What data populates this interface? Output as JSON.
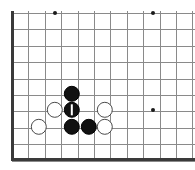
{
  "app": {
    "title": "Go Board Diagram",
    "board_type": "go-board",
    "view": "bottom-left-corner",
    "background_color": "#ffffff",
    "grid_line_color": "#8a8a8a",
    "border_line_color": "#3a3a3a",
    "black_stone_color": "#111111",
    "white_stone_color": "#ffffff",
    "white_stone_outline_color": "#4a4a4a",
    "star_point_color": "#1a1a1a",
    "move_marker_color": "#ffffff"
  },
  "board": {
    "width": 195,
    "height": 170,
    "cell_size": 16.4,
    "origin_x": 12,
    "origin_y": 13,
    "columns": 12,
    "rows": 10,
    "stone_radius": 8.2,
    "vertical_lines_x": [
      12,
      28.4,
      44.8,
      61.2,
      77.6,
      94,
      110.4,
      126.8,
      143.2,
      159.6,
      176,
      192.4
    ],
    "horizontal_lines_y": [
      13,
      29.4,
      45.8,
      62.2,
      78.6,
      95,
      111.4,
      127.8,
      144.2,
      160.6
    ],
    "borders": [
      {
        "name": "left-border",
        "orientation": "v",
        "x": 12,
        "y1": 11,
        "y2": 161
      },
      {
        "name": "bottom-border",
        "orientation": "h",
        "y": 159,
        "x1": 11,
        "x2": 195
      }
    ],
    "star_points": [
      {
        "name": "star-point-1",
        "x": 55,
        "y": 13
      },
      {
        "name": "star-point-2",
        "x": 153,
        "y": 13
      },
      {
        "name": "star-point-3",
        "x": 153,
        "y": 110
      }
    ],
    "stones": [
      {
        "id": "b1",
        "color": "black",
        "x": 72,
        "y": 94,
        "marked": false,
        "label": "black-stone"
      },
      {
        "id": "b2",
        "color": "black",
        "x": 72,
        "y": 110,
        "marked": true,
        "label": "black-stone-last-move"
      },
      {
        "id": "b3",
        "color": "black",
        "x": 72,
        "y": 127,
        "marked": false,
        "label": "black-stone"
      },
      {
        "id": "b4",
        "color": "black",
        "x": 89,
        "y": 127,
        "marked": false,
        "label": "black-stone"
      },
      {
        "id": "w1",
        "color": "white",
        "x": 55,
        "y": 110,
        "marked": false,
        "label": "white-stone"
      },
      {
        "id": "w2",
        "color": "white",
        "x": 105,
        "y": 110,
        "marked": false,
        "label": "white-stone"
      },
      {
        "id": "w3",
        "color": "white",
        "x": 105,
        "y": 127,
        "marked": false,
        "label": "white-stone"
      },
      {
        "id": "w4",
        "color": "white",
        "x": 39,
        "y": 127,
        "marked": false,
        "label": "white-stone"
      }
    ],
    "move_marker": {
      "type": "vertical-bar",
      "width": 2,
      "height": 11,
      "on_stone": "b2"
    },
    "counts": {
      "black_stones": 4,
      "white_stones": 4,
      "total_stones": 8
    }
  }
}
